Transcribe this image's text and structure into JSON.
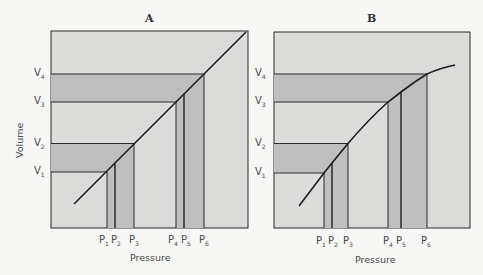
{
  "colors": {
    "background": "#f7f7f5",
    "panel_fill": "#dcdcdb",
    "band_fill": "#bfbfbf",
    "line": "#1e1e1e"
  },
  "axes": {
    "y_label": "Volume",
    "x_label": "Pressure"
  },
  "panels": [
    {
      "title": "A",
      "curve": "linear",
      "v_labels": [
        "V",
        "V",
        "V",
        "V"
      ],
      "v_subs": [
        "1",
        "2",
        "3",
        "4"
      ],
      "p_labels": [
        "P",
        "P",
        "P",
        "P",
        "P",
        "P"
      ],
      "p_subs": [
        "1",
        "2",
        "3",
        "4",
        "5",
        "6"
      ],
      "x_label": "Pressure"
    },
    {
      "title": "B",
      "curve": "concave",
      "v_labels": [
        "V",
        "V",
        "V",
        "V"
      ],
      "v_subs": [
        "1",
        "2",
        "3",
        "4"
      ],
      "p_labels": [
        "P",
        "P",
        "P",
        "P",
        "P",
        "P"
      ],
      "p_subs": [
        "1",
        "2",
        "3",
        "4",
        "5",
        "6"
      ],
      "x_label": "Pressure"
    }
  ]
}
